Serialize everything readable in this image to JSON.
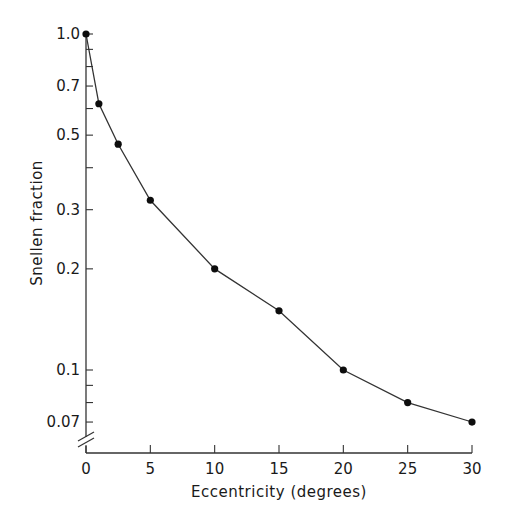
{
  "chart_data": {
    "type": "line",
    "title": "",
    "xlabel": "Eccentricity (degrees)",
    "ylabel": "Snellen fraction",
    "yscale": "log",
    "xlim": [
      0,
      30
    ],
    "ylim": [
      0.06,
      1.0
    ],
    "grid": false,
    "legend": null,
    "x_ticks": [
      0,
      5,
      10,
      15,
      20,
      25,
      30
    ],
    "x_tick_labels": [
      "0",
      "5",
      "10",
      "15",
      "20",
      "25",
      "30"
    ],
    "y_ticks_labeled": [
      1.0,
      0.7,
      0.5,
      0.3,
      0.2,
      0.1,
      0.07
    ],
    "y_tick_labels": [
      "1.0",
      "0.7",
      "0.5",
      "0.3",
      "0.2",
      "0.1",
      "0.07"
    ],
    "y_ticks_minor": [
      0.9,
      0.8,
      0.6,
      0.4,
      0.09,
      0.08
    ],
    "axis_break": "y-axis below 0.07",
    "series": [
      {
        "name": "Snellen fraction vs eccentricity",
        "marker": "filled-circle",
        "x": [
          0,
          1,
          2.5,
          5,
          10,
          15,
          20,
          25,
          30
        ],
        "y": [
          1.0,
          0.62,
          0.47,
          0.32,
          0.2,
          0.15,
          0.1,
          0.08,
          0.07
        ]
      }
    ]
  },
  "labels": {
    "xlabel": "Eccentricity (degrees)",
    "ylabel": "Snellen fraction"
  }
}
